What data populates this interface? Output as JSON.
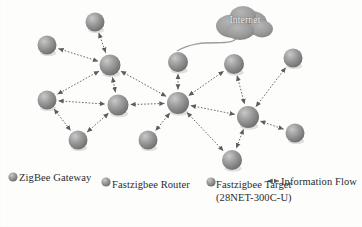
{
  "figure": {
    "type": "network-topology",
    "background_color": "#fdfdfb",
    "node_color": "#8a8a8a",
    "edge_color": "#6b6b6b",
    "cloud_color": "#9a9a9a",
    "text_color": "#2b2b2b"
  },
  "cloud": {
    "label": "Internet",
    "x": 245,
    "y": 22,
    "icon": "cloud-icon"
  },
  "nodes": [
    {
      "id": "n1",
      "x": 95,
      "y": 22,
      "r": 9.5,
      "role": "router"
    },
    {
      "id": "n2",
      "x": 47,
      "y": 45,
      "r": 9.5,
      "role": "router"
    },
    {
      "id": "n3",
      "x": 110,
      "y": 65,
      "r": 10.5,
      "role": "router"
    },
    {
      "id": "n4",
      "x": 47,
      "y": 100,
      "r": 9.5,
      "role": "router"
    },
    {
      "id": "n5",
      "x": 118,
      "y": 105,
      "r": 10.5,
      "role": "router"
    },
    {
      "id": "n6",
      "x": 78,
      "y": 140,
      "r": 9.5,
      "role": "target"
    },
    {
      "id": "n7",
      "x": 178,
      "y": 103,
      "r": 11,
      "role": "router"
    },
    {
      "id": "n8",
      "x": 178,
      "y": 62,
      "r": 10,
      "role": "gateway"
    },
    {
      "id": "n9",
      "x": 148,
      "y": 140,
      "r": 9.5,
      "role": "target"
    },
    {
      "id": "n10",
      "x": 232,
      "y": 160,
      "r": 10,
      "role": "target"
    },
    {
      "id": "n11",
      "x": 234,
      "y": 64,
      "r": 10,
      "role": "router"
    },
    {
      "id": "n12",
      "x": 248,
      "y": 117,
      "r": 11,
      "role": "router"
    },
    {
      "id": "n13",
      "x": 293,
      "y": 58,
      "r": 9.5,
      "role": "target"
    },
    {
      "id": "n14",
      "x": 295,
      "y": 133,
      "r": 9.5,
      "role": "target"
    }
  ],
  "edges": [
    {
      "from": "n1",
      "to": "n3",
      "style": "dotted",
      "arrows": "both"
    },
    {
      "from": "n3",
      "to": "n2",
      "style": "dotted",
      "arrows": "both"
    },
    {
      "from": "n3",
      "to": "n4",
      "style": "dotted",
      "arrows": "both"
    },
    {
      "from": "n3",
      "to": "n5",
      "style": "dotted",
      "arrows": "both"
    },
    {
      "from": "n3",
      "to": "n7",
      "style": "dotted",
      "arrows": "both"
    },
    {
      "from": "n4",
      "to": "n5",
      "style": "dotted",
      "arrows": "both"
    },
    {
      "from": "n4",
      "to": "n6",
      "style": "dotted",
      "arrows": "both"
    },
    {
      "from": "n5",
      "to": "n6",
      "style": "dotted",
      "arrows": "both"
    },
    {
      "from": "n5",
      "to": "n7",
      "style": "dotted",
      "arrows": "both"
    },
    {
      "from": "n8",
      "to": "n7",
      "style": "dotted",
      "arrows": "both"
    },
    {
      "from": "n7",
      "to": "n9",
      "style": "dotted",
      "arrows": "both"
    },
    {
      "from": "n7",
      "to": "n10",
      "style": "dotted",
      "arrows": "both"
    },
    {
      "from": "n7",
      "to": "n11",
      "style": "dotted",
      "arrows": "both"
    },
    {
      "from": "n7",
      "to": "n12",
      "style": "dotted",
      "arrows": "both"
    },
    {
      "from": "n11",
      "to": "n12",
      "style": "dotted",
      "arrows": "both"
    },
    {
      "from": "n12",
      "to": "n13",
      "style": "dotted",
      "arrows": "both"
    },
    {
      "from": "n12",
      "to": "n14",
      "style": "dotted",
      "arrows": "both"
    },
    {
      "from": "n12",
      "to": "n10",
      "style": "dotted",
      "arrows": "both"
    }
  ],
  "cloud_link": {
    "from": "cloud",
    "to": "n8",
    "style": "solid",
    "arrows": "none"
  },
  "legend": {
    "items": [
      {
        "key": "gateway",
        "marker": "node-sphere",
        "label": "ZigBee Gateway",
        "x": 8,
        "y": 177
      },
      {
        "key": "router",
        "marker": "node-sphere",
        "label": "Fastzigbee Router",
        "x": 101,
        "y": 182
      },
      {
        "key": "target",
        "marker": "node-sphere",
        "label": "Fastzigbee Target",
        "x": 206,
        "y": 182
      },
      {
        "key": "flow",
        "marker": "flow-arrow",
        "label": "Information Flow",
        "x": 268,
        "y": 181
      }
    ],
    "target_sublabel": "(28NET-300C-U)"
  }
}
